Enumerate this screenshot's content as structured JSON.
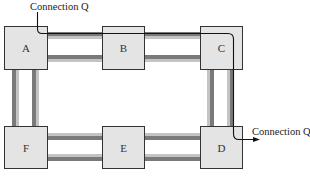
{
  "diagram": {
    "colors": {
      "node_fill": "#e4e4e4",
      "node_stroke": "#333333",
      "cable_dark": "#7a7a7a",
      "cable_light": "#c4c4c4",
      "connection_stroke": "#111111"
    },
    "nodes": [
      {
        "id": "A",
        "label": "A"
      },
      {
        "id": "B",
        "label": "B"
      },
      {
        "id": "C",
        "label": "C"
      },
      {
        "id": "D",
        "label": "D"
      },
      {
        "id": "E",
        "label": "E"
      },
      {
        "id": "F",
        "label": "F"
      }
    ],
    "links": [
      {
        "from": "A",
        "to": "B"
      },
      {
        "from": "B",
        "to": "C"
      },
      {
        "from": "C",
        "to": "D"
      },
      {
        "from": "D",
        "to": "E"
      },
      {
        "from": "E",
        "to": "F"
      },
      {
        "from": "F",
        "to": "A"
      }
    ],
    "connection": {
      "name": "Connection Q",
      "start_label": "Connection Q",
      "end_label": "Connection Q",
      "path": [
        "A",
        "B",
        "C",
        "D"
      ]
    }
  }
}
